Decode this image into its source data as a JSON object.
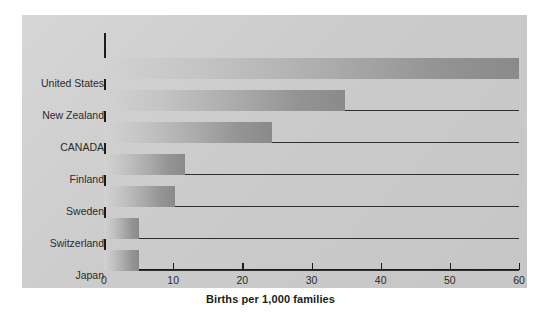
{
  "chart_data": {
    "type": "bar",
    "orientation": "horizontal",
    "title": "",
    "xlabel": "Births per 1,000 families",
    "ylabel": "",
    "xlim": [
      0,
      60
    ],
    "xticks": [
      0,
      10,
      20,
      30,
      40,
      50,
      60
    ],
    "xtick_labels": [
      "0",
      "10",
      "20",
      "30",
      "40",
      "50",
      "60"
    ],
    "grid": false,
    "legend": null,
    "categories": [
      "United States",
      "New Zealand",
      "CANADA",
      "Finland",
      "Sweden",
      "Switzerland",
      "Japan"
    ],
    "values": [
      60,
      34.8,
      24.3,
      11.7,
      10.3,
      5.1,
      5.1
    ],
    "series": [
      {
        "name": "Births per 1,000 families",
        "values": [
          60,
          34.8,
          24.3,
          11.7,
          10.3,
          5.1,
          5.1
        ]
      }
    ],
    "bar_style": {
      "gradient_start": "#d2d2d2",
      "gradient_end": "#8a8a8a",
      "leader_line_color": "#2e2e2e"
    },
    "panel_background": "#cdcdcd",
    "axis_color": "#1c1c1c",
    "text_color": "#2b2b2b"
  }
}
